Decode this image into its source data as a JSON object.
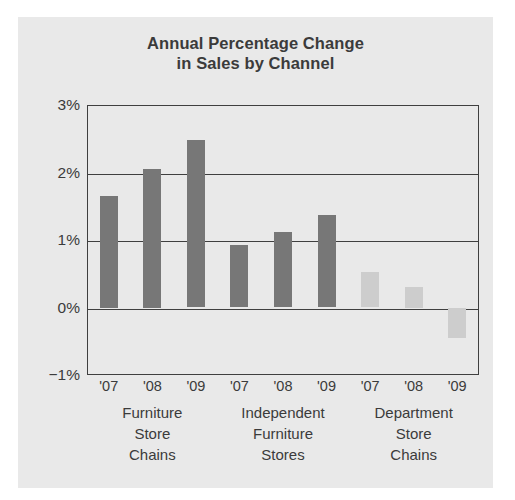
{
  "figure": {
    "background_color": "#e9e9e9",
    "page_background": "#ffffff"
  },
  "chart_data": {
    "type": "bar",
    "title": "Annual Percentage Change in Sales by Channel",
    "title_line1": "Annual Percentage Change",
    "title_line2": "in Sales by Channel",
    "xlabel": "",
    "ylabel": "",
    "ylim": [
      -1,
      3
    ],
    "grid": true,
    "gridlines": [
      3,
      2,
      1,
      0,
      -1
    ],
    "legend_position": "none",
    "categories": [
      "'07",
      "'08",
      "'09",
      "'07",
      "'08",
      "'09",
      "'07",
      "'08",
      "'09"
    ],
    "ytick_labels": [
      "3%",
      "2%",
      "1%",
      "0%",
      "−1%"
    ],
    "ytick_values": [
      3,
      2,
      1,
      0,
      -1
    ],
    "groups": [
      {
        "name": "Furniture Store Chains",
        "label_lines": [
          "Furniture",
          "Store",
          "Chains"
        ],
        "color": "#777777",
        "points": [
          {
            "x": "'07",
            "value": 1.65
          },
          {
            "x": "'08",
            "value": 2.05
          },
          {
            "x": "'09",
            "value": 2.48
          }
        ]
      },
      {
        "name": "Independent Furniture Stores",
        "label_lines": [
          "Independent",
          "Furniture",
          "Stores"
        ],
        "color": "#777777",
        "points": [
          {
            "x": "'07",
            "value": 0.93
          },
          {
            "x": "'08",
            "value": 1.12
          },
          {
            "x": "'09",
            "value": 1.37
          }
        ]
      },
      {
        "name": "Department Store Chains",
        "label_lines": [
          "Department",
          "Store",
          "Chains"
        ],
        "color": "#cdcdcd",
        "points": [
          {
            "x": "'07",
            "value": 0.52
          },
          {
            "x": "'08",
            "value": 0.3
          },
          {
            "x": "'09",
            "value": -0.45
          }
        ]
      }
    ],
    "values": [
      1.65,
      2.05,
      2.48,
      0.93,
      1.12,
      1.37,
      0.52,
      0.3,
      -0.45
    ],
    "bar_colors": [
      "#777777",
      "#777777",
      "#777777",
      "#777777",
      "#777777",
      "#777777",
      "#cdcdcd",
      "#cdcdcd",
      "#cdcdcd"
    ],
    "axis_color": "#3f3f3f",
    "text_color": "#3b3b3b"
  }
}
